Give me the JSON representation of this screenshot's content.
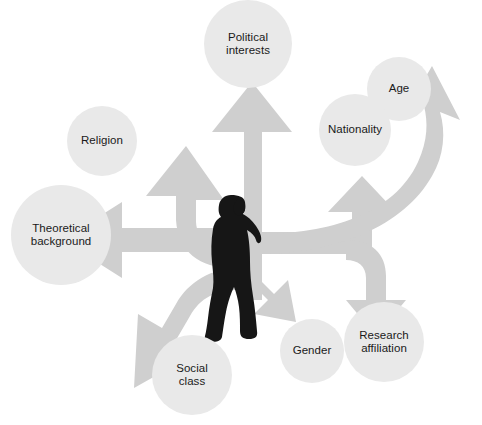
{
  "figure": {
    "type": "radial-arrow-diagram",
    "center": {
      "name": "researcher-silhouette",
      "description": "Black silhouette of a walking woman facing right"
    },
    "colors": {
      "background": "#ffffff",
      "arrow_fill": "#cfcfcf",
      "bubble_fill": "#e9e9e9",
      "silhouette": "#161616",
      "label_text": "#1a1a1a"
    },
    "arrow_count": 8,
    "nodes": [
      {
        "id": "political-interests",
        "label": "Political\ninterests",
        "direction": "up",
        "cx": 248,
        "cy": 44,
        "r": 44
      },
      {
        "id": "age",
        "label": "Age",
        "direction": "up-right",
        "cx": 399,
        "cy": 89,
        "r": 32
      },
      {
        "id": "nationality",
        "label": "Nationality",
        "direction": "right-up",
        "cx": 355,
        "cy": 130,
        "r": 36
      },
      {
        "id": "religion",
        "label": "Religion",
        "direction": "up-left",
        "cx": 102,
        "cy": 141,
        "r": 35
      },
      {
        "id": "theoretical-background",
        "label": "Theoretical\nbackground",
        "direction": "left",
        "cx": 61,
        "cy": 235,
        "r": 50
      },
      {
        "id": "social-class",
        "label": "Social\nclass",
        "direction": "down-left",
        "cx": 192,
        "cy": 375,
        "r": 40
      },
      {
        "id": "gender",
        "label": "Gender",
        "direction": "down",
        "cx": 312,
        "cy": 351,
        "r": 32
      },
      {
        "id": "research-affiliation",
        "label": "Research\naffiliation",
        "direction": "down-right",
        "cx": 384,
        "cy": 342,
        "r": 40
      }
    ]
  }
}
